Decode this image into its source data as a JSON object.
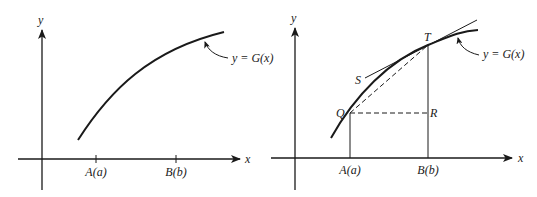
{
  "left_panel": {
    "y_axis_label": "y",
    "x_axis_label": "x",
    "ticks": [
      {
        "label": "A(a)"
      },
      {
        "label": "B(b)"
      }
    ],
    "curve_label": "y = G(x)"
  },
  "right_panel": {
    "y_axis_label": "y",
    "x_axis_label": "x",
    "ticks": [
      {
        "label": "A(a)"
      },
      {
        "label": "B(b)"
      }
    ],
    "curve_label": "y = G(x)",
    "points": {
      "Q": "Q",
      "R": "R",
      "T": "T",
      "S": "S"
    }
  },
  "colors": {
    "ink": "#1a1a1a",
    "background": "#ffffff"
  }
}
